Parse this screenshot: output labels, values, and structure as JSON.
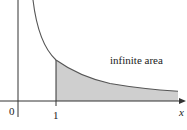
{
  "diagram": {
    "function": "y = 1/x",
    "annotation": "infinite area",
    "axes": {
      "x_label": "x",
      "origin_label": "0",
      "tick_labels": [
        "1"
      ]
    },
    "shaded_region": {
      "from_x": 1,
      "to": "infinity",
      "label": "infinite area"
    },
    "colors": {
      "curve": "#555555",
      "axes": "#333333",
      "shade": "#cfcfcf",
      "background": "#ffffff"
    }
  }
}
